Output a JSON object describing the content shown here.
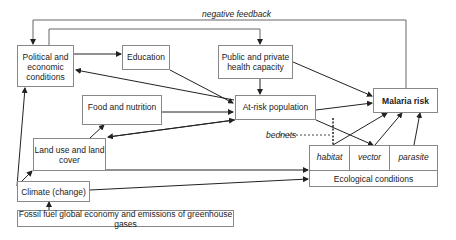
{
  "diagram": {
    "labels": {
      "negative_feedback": "negative feedback",
      "bednets": "bednets"
    },
    "nodes": {
      "political": "Political and economic conditions",
      "education": "Education",
      "health": "Public and private health capacity",
      "food": "Food and nutrition",
      "atrisk": "At-risk population",
      "malaria": "Malaria risk",
      "landuse": "Land use and land cover",
      "climate": "Climate (change)",
      "fossil": "Fossil fuel global economy and emissions of greenhouse gases",
      "ecological": "Ecological conditions",
      "habitat": "habitat",
      "vector": "vector",
      "parasite": "parasite"
    },
    "colors": {
      "line": "#222222",
      "border": "#888888",
      "background": "#ffffff"
    }
  }
}
